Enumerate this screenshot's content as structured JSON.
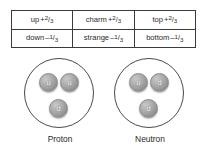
{
  "figure": {
    "background_color": "#ffffff",
    "line_color": "#4a4a4a",
    "quark_fill_color": "#a0a0a0",
    "text_color": "#2b2b2b"
  },
  "quark_table": {
    "rows": [
      [
        {
          "name": "up",
          "sign": "+",
          "numerator": "2",
          "slash": "/",
          "denominator": "3"
        },
        {
          "name": "charm",
          "sign": "+",
          "numerator": "2",
          "slash": "/",
          "denominator": "3"
        },
        {
          "name": "top",
          "sign": "+",
          "numerator": "2",
          "slash": "/",
          "denominator": "3"
        }
      ],
      [
        {
          "name": "down",
          "sign": "–",
          "numerator": "1",
          "slash": "/",
          "denominator": "3"
        },
        {
          "name": "strange",
          "sign": "–",
          "numerator": "1",
          "slash": "/",
          "denominator": "3"
        },
        {
          "name": "bottom",
          "sign": "–",
          "numerator": "1",
          "slash": "/",
          "denominator": "3"
        }
      ]
    ]
  },
  "nucleons": [
    {
      "label": "Proton",
      "quarks": {
        "left": "u",
        "right": "u",
        "bottom": "d"
      }
    },
    {
      "label": "Neutron",
      "quarks": {
        "left": "u",
        "right": "d",
        "bottom": "d"
      }
    }
  ]
}
